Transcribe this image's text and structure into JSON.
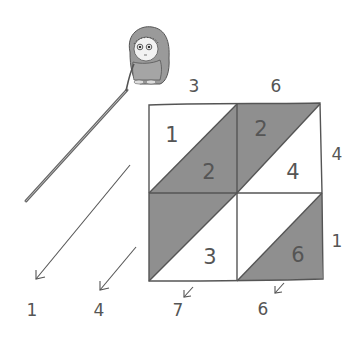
{
  "figure": {
    "top_digits": [
      "3",
      "6"
    ],
    "right_digits": [
      "4",
      "1"
    ],
    "cells": [
      {
        "row": 0,
        "col": 0,
        "tens": "1",
        "ones": "2"
      },
      {
        "row": 0,
        "col": 1,
        "tens": "2",
        "ones": "4"
      },
      {
        "row": 1,
        "col": 0,
        "tens": "",
        "ones": "3"
      },
      {
        "row": 1,
        "col": 1,
        "tens": "",
        "ones": "6"
      }
    ],
    "result_digits": [
      "1",
      "4",
      "7",
      "6"
    ],
    "colors": {
      "shade": "#8f8f8f",
      "line": "#555555",
      "background": "#ffffff"
    },
    "character": "girl-with-pointer"
  }
}
